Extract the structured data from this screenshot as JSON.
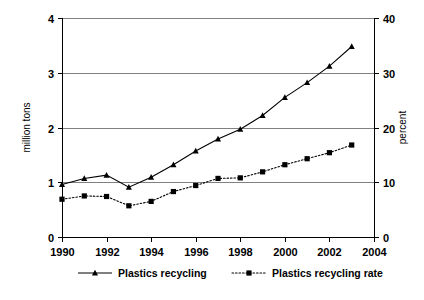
{
  "chart_data": {
    "type": "line",
    "title": "",
    "subtitle": "",
    "xlabel": "",
    "ylabel": "million tons",
    "y2label": "percent",
    "x": [
      1990,
      1991,
      1992,
      1993,
      1994,
      1995,
      1996,
      1997,
      1998,
      1999,
      2000,
      2001,
      2002,
      2003
    ],
    "xlim": [
      1990,
      2004
    ],
    "xticks": [
      1990,
      1992,
      1994,
      1996,
      1998,
      2000,
      2002,
      2004
    ],
    "xtick_labels": [
      "1990",
      "1992",
      "1994",
      "1996",
      "1998",
      "2000",
      "2002",
      "2004"
    ],
    "ylim": [
      0,
      4
    ],
    "yticks": [
      0,
      1,
      2,
      3,
      4
    ],
    "ytick_labels": [
      "0",
      "1",
      "2",
      "3",
      "4"
    ],
    "y2lim": [
      0,
      40
    ],
    "y2ticks": [
      0,
      10,
      20,
      30,
      40
    ],
    "y2tick_labels": [
      "0",
      "10",
      "20",
      "30",
      "40"
    ],
    "grid": true,
    "legend_position": "bottom",
    "series": [
      {
        "name": "Plastics recycling",
        "axis": "left",
        "unit": "million tons",
        "line_style": "solid",
        "marker": "triangle",
        "color": "#000000",
        "values": [
          0.96,
          1.07,
          1.13,
          0.91,
          1.09,
          1.32,
          1.57,
          1.79,
          1.97,
          2.22,
          2.55,
          2.82,
          3.12,
          3.48
        ]
      },
      {
        "name": "Plastics recycling rate",
        "axis": "right",
        "unit": "percent",
        "line_style": "dotted",
        "marker": "square",
        "color": "#000000",
        "values": [
          6.9,
          7.5,
          7.4,
          5.7,
          6.5,
          8.3,
          9.4,
          10.7,
          10.8,
          11.9,
          13.2,
          14.3,
          15.4,
          16.8
        ]
      }
    ]
  },
  "legend": {
    "entries": [
      {
        "label": "Plastics recycling",
        "marker": "triangle-marker",
        "line_style": "solid"
      },
      {
        "label": "Plastics recycling rate",
        "marker": "square-marker",
        "line_style": "dotted"
      }
    ]
  }
}
